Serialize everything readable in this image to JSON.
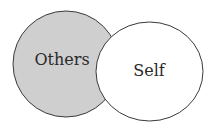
{
  "diagram": {
    "type": "venn",
    "circles": [
      {
        "id": "others",
        "label": "Others",
        "fill": "#cfcfcf"
      },
      {
        "id": "self",
        "label": "Self",
        "fill": "#ffffff"
      }
    ],
    "stroke": "#3a3a3a"
  }
}
